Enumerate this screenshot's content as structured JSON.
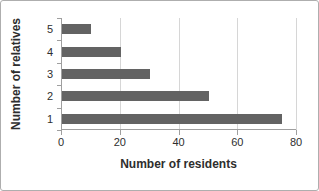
{
  "chart_data": {
    "type": "bar",
    "orientation": "horizontal",
    "title": "",
    "xlabel": "Number of residents",
    "ylabel": "Number of relatives",
    "categories": [
      "5",
      "4",
      "3",
      "2",
      "1"
    ],
    "values": [
      10,
      20,
      30,
      50,
      75
    ],
    "xlim": [
      0,
      80
    ],
    "xticks": [
      0,
      20,
      40,
      60,
      80
    ],
    "grid": true,
    "legend": false,
    "colors": {
      "bar": "#636363",
      "gridline": "#d6d6d6",
      "axis": "#9f9f9f",
      "text": "#2e2e2e",
      "frame_border": "#aeaeae",
      "background": "#ffffff"
    }
  }
}
